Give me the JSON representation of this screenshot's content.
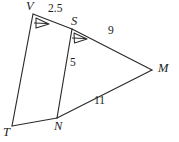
{
  "figure": {
    "type": "geometry-diagram",
    "background_color": "#ffffff",
    "stroke_color": "#2b2b2b",
    "vertices": [
      {
        "id": "V",
        "label": "V",
        "x": 33,
        "y": 14,
        "label_x": 26,
        "label_y": 0
      },
      {
        "id": "S",
        "label": "S",
        "x": 72,
        "y": 29,
        "label_x": 71,
        "label_y": 15
      },
      {
        "id": "M",
        "label": "M",
        "x": 152,
        "y": 70,
        "label_x": 158,
        "label_y": 62
      },
      {
        "id": "N",
        "label": "N",
        "x": 57,
        "y": 118,
        "label_x": 54,
        "label_y": 120
      },
      {
        "id": "T",
        "label": "T",
        "x": 12,
        "y": 126,
        "label_x": 3,
        "label_y": 126
      }
    ],
    "segments": [
      {
        "id": "VT",
        "from": "V",
        "to": "T"
      },
      {
        "id": "VS",
        "from": "V",
        "to": "S"
      },
      {
        "id": "SM",
        "from": "S",
        "to": "M"
      },
      {
        "id": "SN",
        "from": "S",
        "to": "N"
      },
      {
        "id": "TN",
        "from": "T",
        "to": "N"
      },
      {
        "id": "NM",
        "from": "N",
        "to": "M"
      }
    ],
    "side_labels": [
      {
        "id": "VS-length",
        "text": "2.5",
        "x": 48,
        "y": 9
      },
      {
        "id": "SM-length",
        "text": "9",
        "x": 108,
        "y": 30
      },
      {
        "id": "SN-length",
        "text": "5",
        "x": 70,
        "y": 62
      },
      {
        "id": "NM-length",
        "text": "11",
        "x": 94,
        "y": 100
      }
    ],
    "angle_marks": [
      {
        "id": "angle-V",
        "at": "V",
        "style": "single-arrow"
      },
      {
        "id": "angle-S",
        "at": "S",
        "style": "single-arrow"
      }
    ]
  }
}
